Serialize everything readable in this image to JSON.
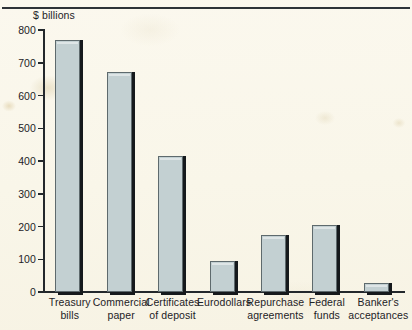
{
  "chart_data": {
    "type": "bar",
    "title": "",
    "subtitle": "",
    "unit_label": "$ billions",
    "xlabel": "",
    "ylabel": "$ billions",
    "ylim": [
      0,
      800
    ],
    "yticks": [
      0,
      100,
      200,
      300,
      400,
      500,
      600,
      700,
      800
    ],
    "ytick_labels": [
      "0",
      "100",
      "200",
      "300",
      "400",
      "500",
      "600",
      "700",
      "800"
    ],
    "grid": false,
    "legend": false,
    "legend_position": "none",
    "categories": [
      "Treasury bills",
      "Commercial paper",
      "Certificates of deposit",
      "Eurodollars",
      "Repurchase agreements",
      "Federal funds",
      "Banker's acceptances"
    ],
    "category_lines": [
      [
        "Treasury",
        "bills"
      ],
      [
        "Commercial",
        "paper"
      ],
      [
        "Certificates",
        "of deposit"
      ],
      [
        "Eurodollars",
        ""
      ],
      [
        "Repurchase",
        "agreements"
      ],
      [
        "Federal",
        "funds"
      ],
      [
        "Banker's",
        "acceptances"
      ]
    ],
    "values": [
      769,
      672,
      415,
      95,
      174,
      205,
      27
    ],
    "bar_fill_color": "#c3d0d2",
    "bar_edge_color": "#5e6a6d",
    "bar_shadow_color": "#15191c",
    "axis_color": "#23282c",
    "background_color": "#faf7ec",
    "text_color": "#1d2226"
  },
  "figure": {
    "unit_label": "$ billions",
    "top_rule_color": "#2e3338"
  }
}
